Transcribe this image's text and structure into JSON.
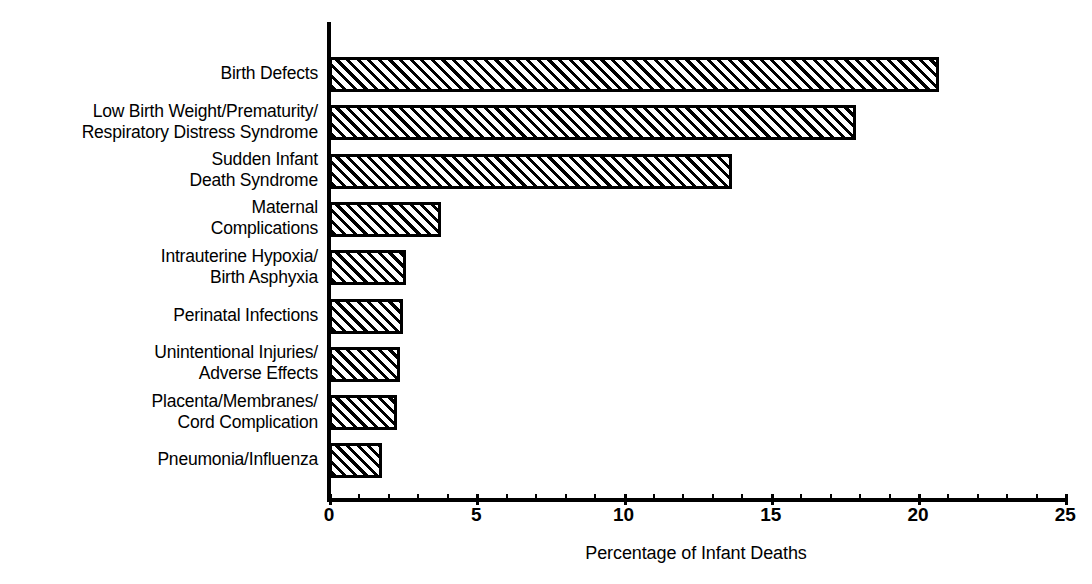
{
  "chart_data": {
    "type": "bar",
    "orientation": "horizontal",
    "title": "",
    "xlabel": "Percentage of Infant Deaths",
    "ylabel": "",
    "xlim": [
      0,
      25
    ],
    "grid": false,
    "legend": null,
    "tick_labels": [
      "0",
      "5",
      "10",
      "15",
      "20",
      "25"
    ],
    "tick_values": [
      0,
      5,
      10,
      15,
      20,
      25
    ],
    "minor_tick_interval": 1,
    "categories": [
      "Birth Defects",
      "Low Birth Weight/Prematurity/\nRespiratory Distress Syndrome",
      "Sudden Infant\nDeath Syndrome",
      "Maternal\nComplications",
      "Intrauterine Hypoxia/\nBirth Asphyxia",
      "Perinatal Infections",
      "Unintentional Injuries/\nAdverse Effects",
      "Placenta/Membranes/\nCord Complication",
      "Pneumonia/Influenza"
    ],
    "values": [
      20.7,
      17.9,
      13.7,
      3.8,
      2.6,
      2.5,
      2.4,
      2.3,
      1.8
    ],
    "bar_fill": "diagonal-hatch",
    "bar_edge_color": "#000000",
    "bar_face_color": "#ffffff"
  },
  "axis": {
    "x_title": "Percentage of Infant Deaths"
  },
  "ticks": [
    {
      "label": "0",
      "value": 0
    },
    {
      "label": "5",
      "value": 5
    },
    {
      "label": "10",
      "value": 10
    },
    {
      "label": "15",
      "value": 15
    },
    {
      "label": "20",
      "value": 20
    },
    {
      "label": "25",
      "value": 25
    }
  ],
  "bars": [
    {
      "label": "Birth Defects",
      "value": 20.7
    },
    {
      "label": "Low Birth Weight/Prematurity/\nRespiratory Distress Syndrome",
      "value": 17.9
    },
    {
      "label": "Sudden Infant\nDeath Syndrome",
      "value": 13.7
    },
    {
      "label": "Maternal\nComplications",
      "value": 3.8
    },
    {
      "label": "Intrauterine Hypoxia/\nBirth Asphyxia",
      "value": 2.6
    },
    {
      "label": "Perinatal Infections",
      "value": 2.5
    },
    {
      "label": "Unintentional Injuries/\nAdverse Effects",
      "value": 2.4
    },
    {
      "label": "Placenta/Membranes/\nCord Complication",
      "value": 2.3
    },
    {
      "label": "Pneumonia/Influenza",
      "value": 1.8
    }
  ]
}
